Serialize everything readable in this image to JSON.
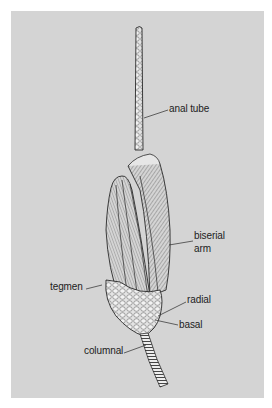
{
  "figure": {
    "background_color": "#d4d4d4",
    "outline_color": "#2a2a2a",
    "labels": [
      {
        "id": "anal_tube",
        "text": "anal tube"
      },
      {
        "id": "biserial_arm_line1",
        "text": "biserial"
      },
      {
        "id": "biserial_arm_line2",
        "text": "arm"
      },
      {
        "id": "tegmen",
        "text": "tegmen"
      },
      {
        "id": "radial",
        "text": "radial"
      },
      {
        "id": "basal",
        "text": "basal"
      },
      {
        "id": "columnal",
        "text": "columnal"
      }
    ]
  }
}
